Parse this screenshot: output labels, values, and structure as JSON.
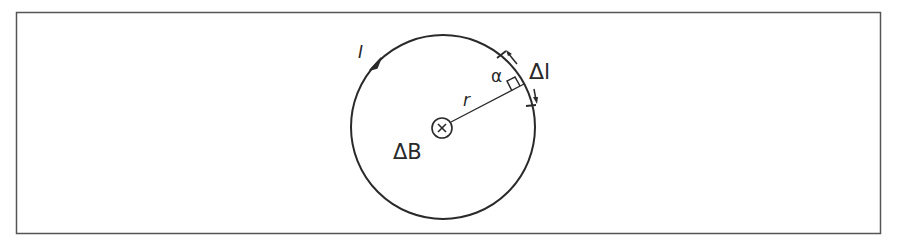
{
  "diagram": {
    "type": "physics-figure",
    "colors": {
      "stroke": "#2a2a2a",
      "frame": "#555555",
      "background": "#ffffff"
    },
    "labels": {
      "current": "I",
      "segment": "Δl",
      "angle": "α",
      "radius": "r",
      "field": "ΔB"
    },
    "symbols": {
      "center": "into-page-cross-icon",
      "current_direction": "arrowhead"
    },
    "geometry": {
      "frame": {
        "x": 16,
        "y": 12,
        "width": 865,
        "height": 222
      },
      "circle": {
        "cx": 443,
        "cy": 127,
        "r": 92
      },
      "center_symbol": {
        "cx": 442,
        "cy": 128,
        "r": 10
      },
      "radius_end": {
        "x": 525,
        "y": 84
      }
    }
  }
}
